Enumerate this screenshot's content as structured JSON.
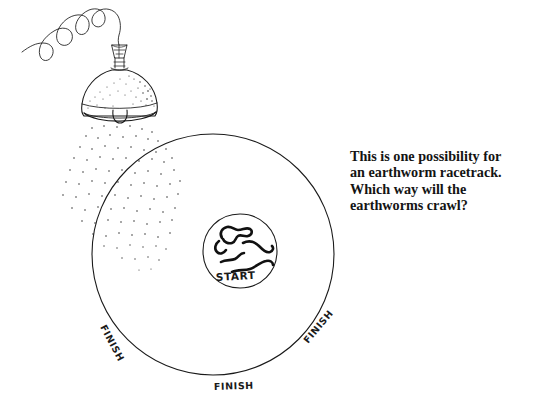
{
  "illustration": {
    "title": "Earthworm racetrack diagram",
    "background_color": "#ffffff",
    "ink_color": "#1a1a1a"
  },
  "caption": {
    "lines": [
      "This is one possibility for",
      "an earthworm racetrack.",
      "Which way will the",
      "earthworms crawl?"
    ],
    "full_text": "This is one possibility for an earthworm racetrack. Which way will the earthworms crawl?"
  },
  "track": {
    "outer_circle_label": "outer racetrack boundary",
    "inner_circle_label": "starting pen",
    "start_label": "START",
    "finish_labels": [
      {
        "id": "finish-left",
        "text": "FINISH",
        "position": "lower-left arc",
        "rotation_deg": 62
      },
      {
        "id": "finish-right",
        "text": "FINISH",
        "position": "lower-right arc",
        "rotation_deg": -50
      },
      {
        "id": "finish-bottom",
        "text": "FINISH",
        "position": "bottom arc",
        "rotation_deg": 0
      }
    ]
  },
  "lamp": {
    "name": "hanging dome lamp",
    "parts": [
      "cord",
      "finial",
      "shade",
      "bulb"
    ],
    "light_description": "stippled light rays falling below the shade"
  },
  "worms": {
    "count": 5,
    "description": "earthworms coiled inside the starting pen"
  }
}
